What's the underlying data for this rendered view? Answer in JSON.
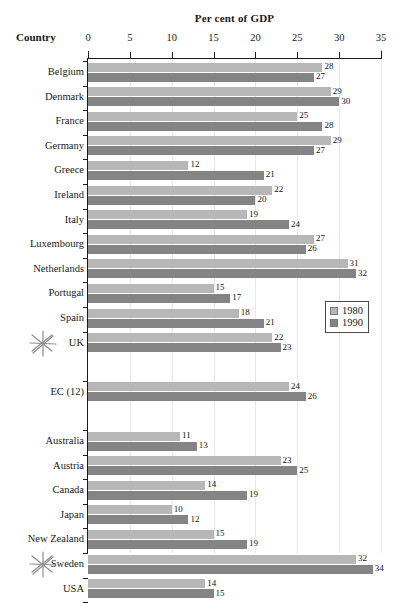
{
  "chart_data": {
    "type": "bar",
    "orientation": "horizontal",
    "title": "Per cent of GDP",
    "xlabel": "Per cent of GDP",
    "ylabel": "Country",
    "xlim": [
      0,
      35
    ],
    "xticks": [
      0,
      5,
      10,
      15,
      20,
      25,
      30,
      35
    ],
    "grid": true,
    "legend_position": "middle-right",
    "categories": [
      "Belgium",
      "Denmark",
      "France",
      "Germany",
      "Greece",
      "Ireland",
      "Italy",
      "Luxembourg",
      "Netherlands",
      "Portugal",
      "Spain",
      "UK",
      "EC (12)",
      "Australia",
      "Austria",
      "Canada",
      "Japan",
      "New Zealand",
      "Sweden",
      "USA"
    ],
    "series": [
      {
        "name": "1980",
        "color": "#b7b7b7",
        "values": [
          28,
          29,
          25,
          29,
          12,
          22,
          19,
          27,
          31,
          15,
          18,
          22,
          24,
          11,
          23,
          14,
          10,
          15,
          32,
          14
        ]
      },
      {
        "name": "1990",
        "color": "#848484",
        "values": [
          27,
          30,
          28,
          27,
          21,
          20,
          24,
          26,
          32,
          17,
          21,
          23,
          26,
          13,
          25,
          19,
          12,
          19,
          34,
          15
        ]
      }
    ],
    "group_gaps_after": [
      "UK",
      "EC (12)"
    ],
    "marked_categories": [
      "UK",
      "Sweden"
    ],
    "marker_glyph": "hand-drawn-asterisk"
  },
  "legend": {
    "entries": [
      {
        "label": "1980",
        "color": "#b7b7b7"
      },
      {
        "label": "1990",
        "color": "#848484"
      }
    ]
  },
  "axis": {
    "title": "Per cent of GDP",
    "country_header": "Country",
    "ticks": [
      "0",
      "5",
      "10",
      "15",
      "20",
      "25",
      "30",
      "35"
    ]
  }
}
